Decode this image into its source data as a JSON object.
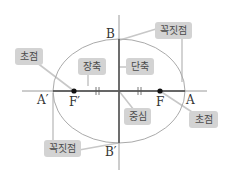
{
  "diagram": {
    "points": {
      "A": "A",
      "A_prime": "A′",
      "B": "B",
      "B_prime": "B′",
      "F": "F",
      "F_prime": "F′"
    },
    "labels": {
      "focus_left": "초점",
      "focus_right": "초점",
      "major_axis": "장축",
      "minor_axis": "단축",
      "center": "중심",
      "vertex_top": "꼭짓점",
      "vertex_bottom": "꼭짓점"
    },
    "colors": {
      "axis": "#555555",
      "ellipse": "#aaaaaa",
      "leader": "#c4c4c4",
      "tag_bg": "#d3d3d3",
      "tag_text": "#4a4a4a"
    }
  }
}
